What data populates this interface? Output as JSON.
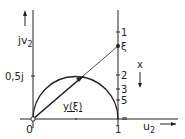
{
  "diagram": {
    "y_axis_label_main": "jv",
    "y_axis_label_sub": "2",
    "y_tick_label": "0,5j",
    "origin_label": "0",
    "x_tick_label": "1",
    "x_axis_label_main": "u",
    "x_axis_label_sub": "2",
    "vector_label": "y(ξ)",
    "scale_labels": {
      "one": "1",
      "xi": "ξ",
      "two": "2",
      "three": "3",
      "five": "5",
      "inf": "∞"
    },
    "scale_title": "x",
    "colors": {
      "stroke": "#222222",
      "background": "#ffffff"
    }
  }
}
